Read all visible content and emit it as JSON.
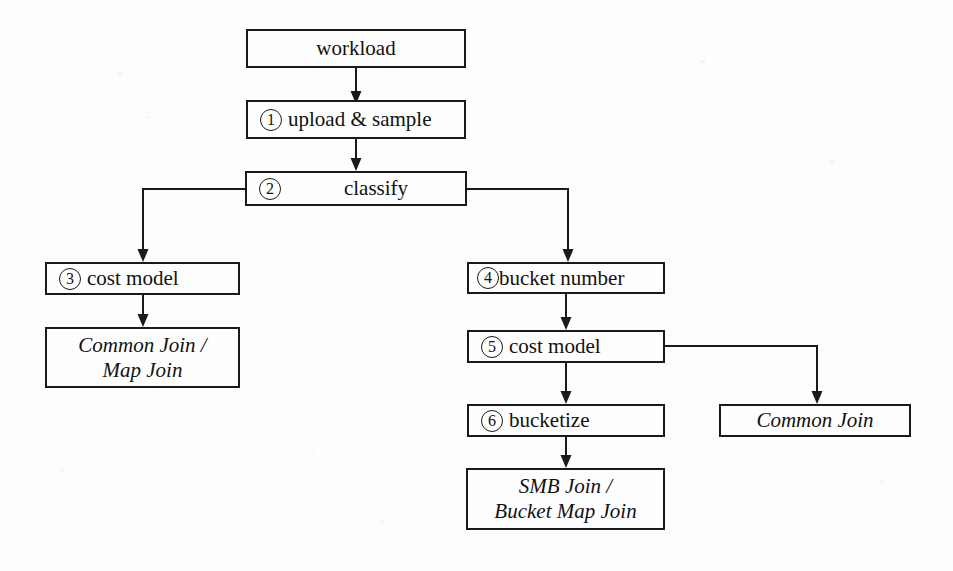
{
  "diagram": {
    "background_color": "#fdfdfd",
    "line_color": "#1a1a1a",
    "nodes": [
      {
        "id": "workload",
        "number": "",
        "text": "workload",
        "style": "plain"
      },
      {
        "id": "upload",
        "number": "1",
        "text": "upload & sample",
        "style": "plain"
      },
      {
        "id": "classify",
        "number": "2",
        "text": "classify",
        "style": "plain"
      },
      {
        "id": "cost-model-3",
        "number": "3",
        "text": "cost model",
        "style": "plain"
      },
      {
        "id": "common-map",
        "number": "",
        "text": "Common Join /\nMap Join",
        "style": "italic"
      },
      {
        "id": "bucket-number",
        "number": "4",
        "text": "bucket number",
        "style": "plain"
      },
      {
        "id": "cost-model-5",
        "number": "5",
        "text": "cost model",
        "style": "plain"
      },
      {
        "id": "bucketize",
        "number": "6",
        "text": "bucketize",
        "style": "plain"
      },
      {
        "id": "smb-bucketmap",
        "number": "",
        "text": "SMB Join /\nBucket Map Join",
        "style": "italic"
      },
      {
        "id": "common-join",
        "number": "",
        "text": "Common Join",
        "style": "italic"
      }
    ],
    "edges": [
      {
        "from": "workload",
        "to": "upload",
        "kind": "straight-down"
      },
      {
        "from": "upload",
        "to": "classify",
        "kind": "straight-down"
      },
      {
        "from": "classify",
        "to": "cost-model-3",
        "kind": "left-then-down"
      },
      {
        "from": "classify",
        "to": "bucket-number",
        "kind": "right-then-down"
      },
      {
        "from": "cost-model-3",
        "to": "common-map",
        "kind": "straight-down"
      },
      {
        "from": "bucket-number",
        "to": "cost-model-5",
        "kind": "straight-down"
      },
      {
        "from": "cost-model-5",
        "to": "bucketize",
        "kind": "straight-down"
      },
      {
        "from": "cost-model-5",
        "to": "common-join",
        "kind": "right-then-down"
      },
      {
        "from": "bucketize",
        "to": "smb-bucketmap",
        "kind": "straight-down"
      }
    ]
  }
}
